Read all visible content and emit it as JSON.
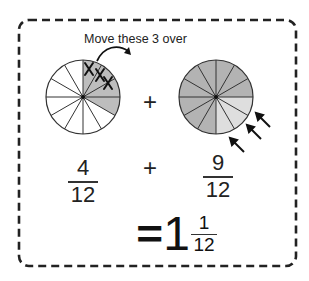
{
  "caption": "Move these 3 over",
  "left_circle": {
    "slices": 12,
    "shaded": 4,
    "crossed": 3,
    "shade_color": "#bdbdbd"
  },
  "right_circle": {
    "slices": 12,
    "shaded_dark": 9,
    "shaded_light": 3,
    "dark_color": "#b3b3b3",
    "light_color": "#dedede",
    "arrows": 3
  },
  "top_plus": "+",
  "equation": {
    "left": {
      "numerator": "4",
      "denominator": "12"
    },
    "operator": "+",
    "right": {
      "numerator": "9",
      "denominator": "12"
    },
    "result": {
      "equals": "=",
      "whole": "1",
      "numerator": "1",
      "denominator": "12"
    }
  },
  "colors": {
    "border": "#222222",
    "line": "#333333"
  }
}
